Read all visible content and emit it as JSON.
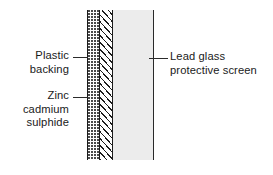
{
  "figure": {
    "background_color": "#ffffff",
    "line_color": "#2b2b2b"
  },
  "layers": [
    {
      "id": "plastic-backing",
      "name": "Plastic backing",
      "pattern": "stipple-dots",
      "fill_color": "#ffffff",
      "pattern_color": "#4a4a4a"
    },
    {
      "id": "zinc-cadmium-sulphide",
      "name": "Zinc cadmium sulphide",
      "pattern": "diagonal-hatch",
      "fill_color": "#ffffff",
      "pattern_color": "#1c1c1c"
    },
    {
      "id": "lead-glass-protective-screen",
      "name": "Lead glass protective screen",
      "pattern": "solid",
      "fill_color": "#ececec",
      "pattern_color": "#ececec"
    }
  ],
  "callouts": {
    "plastic_backing": "Plastic\nbacking",
    "zinc_cadmium_sulphide": "Zinc cadmium\nsulphide",
    "lead_glass_protective_screen": "Lead glass\nprotective screen"
  }
}
